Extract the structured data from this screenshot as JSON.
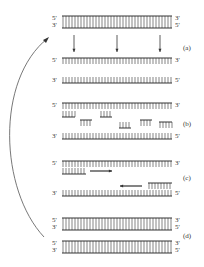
{
  "labels": {
    "five": "5'",
    "three": "3'"
  },
  "steps": {
    "a": "(a)",
    "b": "(b)",
    "c": "(c)",
    "d": "(d)"
  },
  "colors": {
    "ink": "#333333",
    "curve": "#555555"
  },
  "strands": [
    {
      "y": 16,
      "left": "5'",
      "right": "3'",
      "ticks": "down"
    },
    {
      "y": 28,
      "left": "3'",
      "right": "5'",
      "ticks": "up"
    },
    {
      "y": 58,
      "left": "5'",
      "right": "3'",
      "ticks": "down"
    },
    {
      "y": 83,
      "left": "3'",
      "right": "5'",
      "ticks": "up"
    },
    {
      "y": 103,
      "left": "5'",
      "right": "3'",
      "ticks": "down"
    },
    {
      "y": 139,
      "left": "3'",
      "right": "5'",
      "ticks": "up"
    },
    {
      "y": 161,
      "left": "5'",
      "right": "3'",
      "ticks": "down"
    },
    {
      "y": 196,
      "left": "3'",
      "right": "5'",
      "ticks": "up"
    },
    {
      "y": 218,
      "left": "5'",
      "right": "3'",
      "ticks": "down"
    },
    {
      "y": 230,
      "left": "3'",
      "right": "5'",
      "ticks": "up"
    },
    {
      "y": 241,
      "left": "5'",
      "right": "3'",
      "ticks": "down"
    },
    {
      "y": 253,
      "left": "3'",
      "right": "5'",
      "ticks": "up"
    }
  ]
}
